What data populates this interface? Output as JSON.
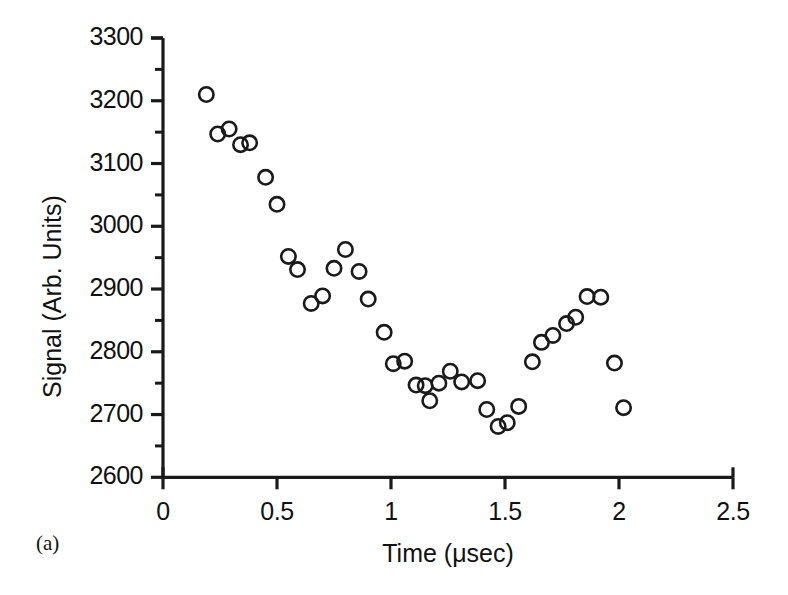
{
  "figure": {
    "panel_tag": "(a)",
    "background_color": "#ffffff",
    "ink_color": "#1a1a1a"
  },
  "axes": {
    "x": {
      "label": "Time (μsec)",
      "tick_labels": [
        "0",
        "0.5",
        "1",
        "1.5",
        "2",
        "2.5"
      ],
      "tick_values": [
        0,
        0.5,
        1,
        1.5,
        2,
        2.5
      ],
      "minor_ticks_per_interval": 0
    },
    "y": {
      "label": "Signal (Arb. Units)",
      "tick_labels": [
        "2600",
        "2700",
        "2800",
        "2900",
        "3000",
        "3100",
        "3200",
        "3300"
      ],
      "tick_values": [
        2600,
        2700,
        2800,
        2900,
        3000,
        3100,
        3200,
        3300
      ],
      "minor_ticks_per_interval": 1
    }
  },
  "chart_data": {
    "type": "scatter",
    "title": "",
    "subtitle": "",
    "xlabel": "Time (μsec)",
    "ylabel": "Signal (Arb. Units)",
    "xlim": [
      0,
      2.5
    ],
    "ylim": [
      2600,
      3300
    ],
    "xticks": [
      0,
      0.5,
      1,
      1.5,
      2,
      2.5
    ],
    "yticks": [
      2600,
      2700,
      2800,
      2900,
      3000,
      3100,
      3200,
      3300
    ],
    "grid": false,
    "legend": null,
    "marker": "open-circle",
    "marker_size": 9,
    "annotations": [
      "(a)"
    ],
    "series": [
      {
        "name": "Signal",
        "x": [
          0.19,
          0.24,
          0.29,
          0.34,
          0.38,
          0.45,
          0.5,
          0.55,
          0.59,
          0.65,
          0.7,
          0.75,
          0.8,
          0.86,
          0.9,
          0.97,
          1.01,
          1.06,
          1.11,
          1.15,
          1.17,
          1.21,
          1.26,
          1.31,
          1.38,
          1.42,
          1.47,
          1.51,
          1.56,
          1.62,
          1.66,
          1.71,
          1.77,
          1.81,
          1.86,
          1.92,
          1.98,
          2.02
        ],
        "y": [
          3210,
          3147,
          3155,
          3130,
          3133,
          3078,
          3035,
          2952,
          2931,
          2877,
          2889,
          2933,
          2963,
          2928,
          2884,
          2831,
          2781,
          2785,
          2747,
          2746,
          2722,
          2750,
          2769,
          2752,
          2754,
          2708,
          2681,
          2687,
          2713,
          2784,
          2815,
          2826,
          2845,
          2855,
          2888,
          2887,
          2782,
          2711
        ]
      }
    ]
  }
}
